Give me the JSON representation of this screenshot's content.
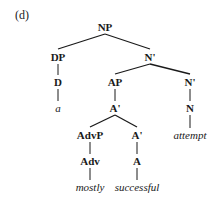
{
  "figure_label": "(d)",
  "tree": {
    "nodes": [
      {
        "id": "np",
        "label": "NP",
        "x": 105,
        "y": 27,
        "type": "node"
      },
      {
        "id": "dp",
        "label": "DP",
        "x": 58,
        "y": 57,
        "type": "node"
      },
      {
        "id": "nbar1",
        "label": "N'",
        "x": 150,
        "y": 57,
        "type": "node"
      },
      {
        "id": "d",
        "label": "D",
        "x": 58,
        "y": 82,
        "type": "node"
      },
      {
        "id": "ap",
        "label": "AP",
        "x": 115,
        "y": 82,
        "type": "node"
      },
      {
        "id": "nbar2",
        "label": "N'",
        "x": 190,
        "y": 82,
        "type": "node"
      },
      {
        "id": "a_word",
        "label": "a",
        "x": 58,
        "y": 108,
        "type": "leaf"
      },
      {
        "id": "abar1",
        "label": "A'",
        "x": 115,
        "y": 108,
        "type": "node"
      },
      {
        "id": "n",
        "label": "N",
        "x": 190,
        "y": 108,
        "type": "node"
      },
      {
        "id": "advp",
        "label": "AdvP",
        "x": 90,
        "y": 135,
        "type": "node"
      },
      {
        "id": "abar2",
        "label": "A'",
        "x": 137,
        "y": 135,
        "type": "node"
      },
      {
        "id": "attempt",
        "label": "attempt",
        "x": 190,
        "y": 135,
        "type": "leaf"
      },
      {
        "id": "adv",
        "label": "Adv",
        "x": 90,
        "y": 161,
        "type": "node"
      },
      {
        "id": "a",
        "label": "A",
        "x": 137,
        "y": 161,
        "type": "node"
      },
      {
        "id": "mostly",
        "label": "mostly",
        "x": 90,
        "y": 187,
        "type": "leaf"
      },
      {
        "id": "successful",
        "label": "successful",
        "x": 137,
        "y": 187,
        "type": "leaf"
      }
    ],
    "edges": [
      [
        "np",
        "dp"
      ],
      [
        "np",
        "nbar1"
      ],
      [
        "dp",
        "d"
      ],
      [
        "d",
        "a_word"
      ],
      [
        "nbar1",
        "ap"
      ],
      [
        "nbar1",
        "nbar2"
      ],
      [
        "ap",
        "abar1"
      ],
      [
        "nbar2",
        "n"
      ],
      [
        "n",
        "attempt"
      ],
      [
        "abar1",
        "advp"
      ],
      [
        "abar1",
        "abar2"
      ],
      [
        "advp",
        "adv"
      ],
      [
        "adv",
        "mostly"
      ],
      [
        "abar2",
        "a"
      ],
      [
        "a",
        "successful"
      ]
    ]
  }
}
